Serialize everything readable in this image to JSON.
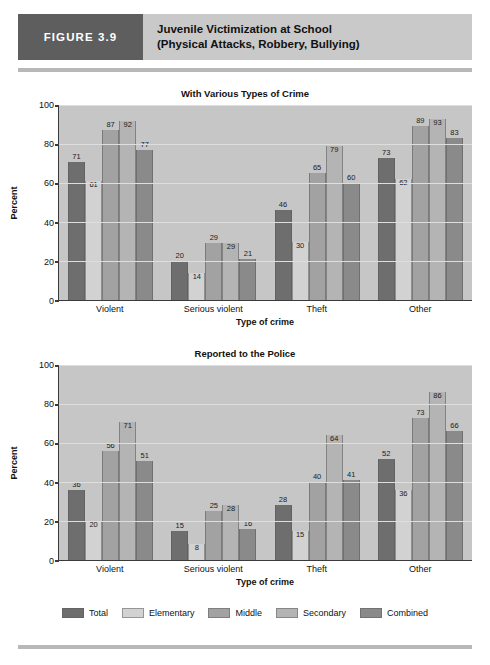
{
  "header": {
    "figure_tag": "FIGURE 3.9",
    "title_line_1": "Juvenile Victimization at School",
    "title_line_2": "(Physical Attacks, Robbery, Bullying)"
  },
  "legend": {
    "items": [
      {
        "label": "Total",
        "color": "#6e6e6e"
      },
      {
        "label": "Elementary",
        "color": "#d2d2d2"
      },
      {
        "label": "Middle",
        "color": "#a2a2a2"
      },
      {
        "label": "Secondary",
        "color": "#b4b4b4"
      },
      {
        "label": "Combined",
        "color": "#8a8a8a"
      }
    ]
  },
  "chart_data": [
    {
      "type": "bar",
      "title": "With Various Types of Crime",
      "xlabel": "Type of crime",
      "ylabel": "Percent",
      "ylim": [
        0,
        100
      ],
      "yticks": [
        0,
        20,
        40,
        60,
        80,
        100
      ],
      "grid": true,
      "legend_position": "bottom",
      "categories": [
        "Violent",
        "Serious violent",
        "Theft",
        "Other"
      ],
      "series": [
        {
          "name": "Total",
          "color": "#6e6e6e",
          "values": [
            71,
            20,
            46,
            73
          ]
        },
        {
          "name": "Elementary",
          "color": "#d2d2d2",
          "values": [
            61,
            14,
            30,
            62
          ]
        },
        {
          "name": "Middle",
          "color": "#a2a2a2",
          "values": [
            87,
            29,
            65,
            89
          ]
        },
        {
          "name": "Secondary",
          "color": "#b4b4b4",
          "values": [
            92,
            29,
            79,
            93
          ]
        },
        {
          "name": "Combined",
          "color": "#8a8a8a",
          "values": [
            77,
            21,
            60,
            83
          ]
        }
      ]
    },
    {
      "type": "bar",
      "title": "Reported to the Police",
      "xlabel": "Type of crime",
      "ylabel": "Percent",
      "ylim": [
        0,
        100
      ],
      "yticks": [
        0,
        20,
        40,
        60,
        80,
        100
      ],
      "grid": true,
      "legend_position": "bottom",
      "categories": [
        "Violent",
        "Serious violent",
        "Theft",
        "Other"
      ],
      "series": [
        {
          "name": "Total",
          "color": "#6e6e6e",
          "values": [
            36,
            15,
            28,
            52
          ]
        },
        {
          "name": "Elementary",
          "color": "#d2d2d2",
          "values": [
            20,
            8,
            15,
            36
          ]
        },
        {
          "name": "Middle",
          "color": "#a2a2a2",
          "values": [
            56,
            25,
            40,
            73
          ]
        },
        {
          "name": "Secondary",
          "color": "#b4b4b4",
          "values": [
            71,
            28,
            64,
            86
          ]
        },
        {
          "name": "Combined",
          "color": "#8a8a8a",
          "values": [
            51,
            16,
            41,
            66
          ]
        }
      ]
    }
  ]
}
